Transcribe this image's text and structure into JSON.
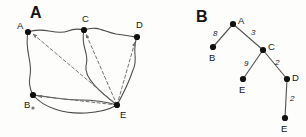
{
  "figure": {
    "background_color": "#fdfdfc",
    "ink_color": "#1a1a1a",
    "panels": [
      {
        "id": "panel-a",
        "label": "A",
        "label_pos": {
          "x": 30,
          "y": 18
        },
        "type": "graph-with-shortest-path-overlay",
        "description": "Hand-drawn undirected graph with dashed arrows radiating from node E",
        "nodes": [
          {
            "id": "A",
            "label": "A",
            "x": 28,
            "y": 32,
            "label_dx": -11,
            "label_dy": -3
          },
          {
            "id": "C",
            "label": "C",
            "x": 84,
            "y": 30,
            "label_dx": -2,
            "label_dy": -8
          },
          {
            "id": "D",
            "label": "D",
            "x": 137,
            "y": 37,
            "label_dx": -1,
            "label_dy": -9
          },
          {
            "id": "B",
            "label": "B",
            "x": 33,
            "y": 95,
            "label_dx": -9,
            "label_dy": 13
          },
          {
            "id": "E",
            "label": "E",
            "x": 117,
            "y": 105,
            "label_dx": 3,
            "label_dy": 13
          }
        ],
        "solid_edges": [
          {
            "from": "A",
            "to": "C"
          },
          {
            "from": "C",
            "to": "D"
          },
          {
            "from": "A",
            "to": "B"
          },
          {
            "from": "C",
            "to": "E"
          },
          {
            "from": "D",
            "to": "E"
          },
          {
            "from": "B",
            "to": "E"
          },
          {
            "from": "B",
            "to": "E",
            "variant": "lower"
          }
        ],
        "dashed_edges": [
          {
            "from": "E",
            "to": "A",
            "arrow": true
          },
          {
            "from": "E",
            "to": "C",
            "arrow": true
          },
          {
            "from": "E",
            "to": "D",
            "arrow": true
          },
          {
            "from": "E",
            "to": "B",
            "arrow": true
          }
        ],
        "speck": {
          "x": 33,
          "y": 108
        }
      },
      {
        "id": "panel-b",
        "label": "B",
        "label_pos": {
          "x": 196,
          "y": 22
        },
        "type": "weighted-tree",
        "description": "Shortest path tree rooted at A with weighted edges",
        "nodes": [
          {
            "id": "A",
            "label": "A",
            "x": 233,
            "y": 24,
            "label_dx": 5,
            "label_dy": -1
          },
          {
            "id": "B",
            "label": "B",
            "x": 213,
            "y": 47,
            "label_dx": -2,
            "label_dy": 12
          },
          {
            "id": "C",
            "label": "C",
            "x": 263,
            "y": 50,
            "label_dx": 5,
            "label_dy": -1
          },
          {
            "id": "E1",
            "label": "E",
            "x": 243,
            "y": 79,
            "label_dx": -2,
            "label_dy": 13
          },
          {
            "id": "D",
            "label": "D",
            "x": 287,
            "y": 79,
            "label_dx": 5,
            "label_dy": 1
          },
          {
            "id": "E2",
            "label": "E",
            "x": 285,
            "y": 118,
            "label_dx": -2,
            "label_dy": 13
          }
        ],
        "edges": [
          {
            "from": "A",
            "to": "B",
            "weight": "8",
            "wx": 215,
            "wy": 34
          },
          {
            "from": "A",
            "to": "C",
            "weight": "3",
            "wx": 253,
            "wy": 33
          },
          {
            "from": "C",
            "to": "E1",
            "weight": "9",
            "wx": 246,
            "wy": 64
          },
          {
            "from": "C",
            "to": "D",
            "weight": "2",
            "wx": 277,
            "wy": 63
          },
          {
            "from": "D",
            "to": "E2",
            "weight": "2",
            "wx": 291,
            "wy": 99
          }
        ]
      }
    ]
  }
}
